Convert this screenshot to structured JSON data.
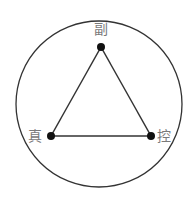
{
  "diagram": {
    "type": "triangle-in-circle",
    "colors": {
      "stroke": "#333333",
      "node": "#111111",
      "label": "#7a7a7a",
      "background": "#ffffff"
    },
    "nodes": [
      {
        "id": "top",
        "label": "副"
      },
      {
        "id": "left",
        "label": "真"
      },
      {
        "id": "right",
        "label": "控"
      }
    ],
    "edges": [
      {
        "from": "top",
        "to": "left"
      },
      {
        "from": "top",
        "to": "right"
      },
      {
        "from": "left",
        "to": "right"
      }
    ]
  }
}
